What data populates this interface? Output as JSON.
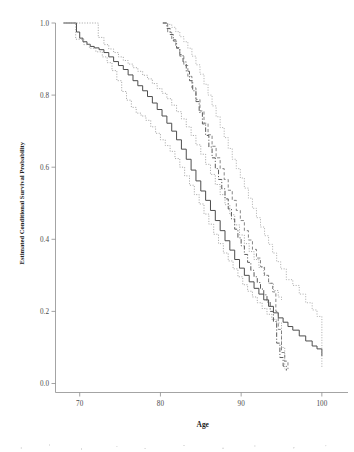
{
  "figure": {
    "background_color": "#ffffff",
    "axis_color": "#8d8d8d",
    "text_color": "#333333"
  },
  "chart_data": {
    "type": "line",
    "title": "",
    "xlabel": "Age",
    "ylabel": "Estimated Conditional Survival Probability",
    "xlim": [
      67,
      102
    ],
    "ylim": [
      0.0,
      1.0
    ],
    "xticks": [
      70,
      80,
      90,
      100
    ],
    "xtick_labels": [
      "70",
      "80",
      "90",
      "100"
    ],
    "yticks": [
      0.0,
      0.2,
      0.4,
      0.6,
      0.8,
      1.0
    ],
    "ytick_labels": [
      "0.0",
      "0.2",
      "0.4",
      "0.6",
      "0.8",
      "1.0"
    ],
    "grid": false,
    "legend": "none",
    "annotations": [],
    "series": [
      {
        "name": "Group A estimate",
        "style": "solid",
        "color": "#4d4d4d",
        "width": 1.0,
        "x": [
          68.0,
          69.1,
          69.6,
          70.0,
          70.4,
          70.9,
          71.3,
          71.8,
          72.4,
          73.0,
          73.6,
          74.2,
          74.8,
          75.4,
          76.0,
          76.6,
          77.2,
          77.8,
          78.4,
          79.0,
          79.6,
          80.2,
          80.8,
          81.4,
          82.0,
          82.6,
          83.2,
          83.8,
          84.4,
          85.0,
          85.6,
          86.2,
          86.8,
          87.4,
          88.0,
          88.6,
          89.2,
          89.8,
          90.4,
          91.0,
          91.6,
          92.2,
          92.8,
          93.4,
          94.0,
          94.6,
          95.2,
          95.8,
          96.4,
          97.2,
          98.0,
          98.8,
          99.4,
          100.0
        ],
        "y": [
          1.0,
          1.0,
          0.975,
          0.958,
          0.948,
          0.941,
          0.935,
          0.931,
          0.926,
          0.918,
          0.906,
          0.893,
          0.882,
          0.871,
          0.856,
          0.84,
          0.826,
          0.812,
          0.796,
          0.778,
          0.76,
          0.742,
          0.722,
          0.7,
          0.676,
          0.65,
          0.622,
          0.592,
          0.562,
          0.534,
          0.508,
          0.48,
          0.452,
          0.424,
          0.396,
          0.37,
          0.344,
          0.32,
          0.3,
          0.282,
          0.264,
          0.248,
          0.232,
          0.214,
          0.196,
          0.182,
          0.17,
          0.158,
          0.148,
          0.132,
          0.118,
          0.104,
          0.096,
          0.076
        ]
      },
      {
        "name": "Group A upper 95% CI",
        "style": "dotted",
        "color": "#9a9a9a",
        "width": 0.85,
        "x": [
          68.0,
          69.5,
          70.5,
          71.5,
          72.2,
          72.3,
          73.0,
          73.6,
          74.2,
          74.8,
          75.4,
          76.0,
          76.6,
          77.2,
          77.8,
          78.4,
          79.0,
          79.6,
          80.2,
          80.8,
          81.4,
          82.0,
          82.6,
          83.2,
          83.8,
          84.4,
          85.0,
          85.6,
          86.2,
          86.8,
          87.4,
          88.0,
          88.6,
          89.2,
          89.8,
          90.4,
          91.0,
          91.6,
          92.2,
          92.8,
          93.4,
          94.0,
          94.6,
          95.0
        ],
        "y": [
          1.0,
          1.0,
          1.0,
          1.0,
          1.0,
          0.96,
          0.94,
          0.928,
          0.918,
          0.906,
          0.896,
          0.886,
          0.876,
          0.866,
          0.855,
          0.845,
          0.832,
          0.818,
          0.805,
          0.79,
          0.772,
          0.754,
          0.734,
          0.712,
          0.688,
          0.662,
          0.636,
          0.608,
          0.58,
          0.552,
          0.524,
          0.496,
          0.468,
          0.44,
          0.412,
          0.388,
          0.366,
          0.344,
          0.322,
          0.3,
          0.278,
          0.258,
          0.24,
          0.232
        ]
      },
      {
        "name": "Group A lower 95% CI",
        "style": "dotted",
        "color": "#9a9a9a",
        "width": 0.85,
        "x": [
          68.0,
          69.5,
          70.5,
          71.2,
          72.0,
          72.8,
          73.4,
          74.0,
          74.6,
          75.2,
          75.8,
          76.4,
          77.0,
          77.6,
          78.2,
          78.8,
          79.4,
          80.0,
          80.6,
          81.2,
          81.8,
          82.4,
          83.0,
          83.6,
          84.2,
          84.8,
          85.4,
          86.0,
          86.6,
          87.2,
          87.8,
          88.4,
          89.0,
          89.6,
          90.2,
          90.8,
          91.4,
          92.0,
          92.6,
          93.2,
          93.8,
          94.4,
          95.0,
          95.4
        ],
        "y": [
          1.0,
          0.955,
          0.94,
          0.93,
          0.92,
          0.906,
          0.89,
          0.868,
          0.84,
          0.81,
          0.786,
          0.766,
          0.75,
          0.742,
          0.73,
          0.712,
          0.694,
          0.676,
          0.66,
          0.644,
          0.624,
          0.6,
          0.576,
          0.55,
          0.524,
          0.498,
          0.47,
          0.442,
          0.414,
          0.388,
          0.362,
          0.34,
          0.318,
          0.296,
          0.274,
          0.256,
          0.24,
          0.224,
          0.208,
          0.192,
          0.178,
          0.168,
          0.1,
          0.04
        ]
      },
      {
        "name": "Group B estimate",
        "style": "dashdot",
        "color": "#5a5a5a",
        "width": 1.0,
        "x": [
          80.3,
          80.8,
          81.2,
          81.6,
          82.0,
          82.4,
          82.8,
          83.2,
          83.6,
          84.0,
          84.4,
          84.8,
          85.2,
          85.6,
          86.0,
          86.4,
          86.8,
          87.2,
          87.6,
          88.0,
          88.4,
          88.8,
          89.2,
          89.6,
          90.0,
          90.4,
          90.8,
          91.2,
          91.6,
          92.0,
          92.4,
          92.8,
          93.2,
          93.6,
          94.0,
          94.4,
          94.8,
          95.2,
          95.6
        ],
        "y": [
          1.0,
          0.985,
          0.968,
          0.95,
          0.93,
          0.912,
          0.892,
          0.866,
          0.84,
          0.812,
          0.782,
          0.752,
          0.72,
          0.688,
          0.656,
          0.626,
          0.596,
          0.566,
          0.54,
          0.512,
          0.484,
          0.456,
          0.428,
          0.404,
          0.382,
          0.358,
          0.336,
          0.314,
          0.296,
          0.28,
          0.262,
          0.246,
          0.226,
          0.2,
          0.172,
          0.112,
          0.072,
          0.048,
          0.036
        ]
      },
      {
        "name": "Group B upper 95% CI",
        "style": "dotted",
        "color": "#a5a5a5",
        "width": 0.85,
        "x": [
          80.3,
          80.9,
          81.4,
          81.9,
          82.4,
          82.9,
          83.4,
          83.9,
          84.4,
          84.9,
          85.4,
          85.9,
          86.4,
          86.9,
          87.4,
          87.9,
          88.4,
          88.9,
          89.4,
          89.9,
          90.4,
          90.9,
          91.4,
          91.9,
          92.4,
          92.9,
          93.4,
          93.9,
          94.4,
          94.9,
          95.6,
          96.4,
          97.2,
          98.0,
          98.8,
          99.4,
          100.0
        ],
        "y": [
          1.0,
          0.996,
          0.988,
          0.976,
          0.962,
          0.948,
          0.93,
          0.908,
          0.884,
          0.858,
          0.83,
          0.8,
          0.77,
          0.74,
          0.71,
          0.682,
          0.652,
          0.622,
          0.596,
          0.57,
          0.542,
          0.514,
          0.486,
          0.46,
          0.434,
          0.41,
          0.386,
          0.362,
          0.338,
          0.318,
          0.288,
          0.272,
          0.248,
          0.224,
          0.204,
          0.186,
          0.042
        ]
      },
      {
        "name": "Group B lower 95% CI",
        "style": "dashed",
        "color": "#707070",
        "width": 0.85,
        "x": [
          80.3,
          80.9,
          81.4,
          81.9,
          82.4,
          82.9,
          83.4,
          83.9,
          84.4,
          84.9,
          85.4,
          85.9,
          86.4,
          86.9,
          87.4,
          87.9,
          88.4,
          88.9,
          89.4,
          89.9,
          90.4,
          90.9,
          91.4,
          91.9,
          92.4,
          92.9,
          93.4,
          93.9,
          94.3,
          94.6,
          95.0,
          95.4,
          95.8
        ],
        "y": [
          1.0,
          0.974,
          0.954,
          0.932,
          0.908,
          0.882,
          0.852,
          0.82,
          0.788,
          0.756,
          0.722,
          0.69,
          0.658,
          0.626,
          0.596,
          0.566,
          0.536,
          0.508,
          0.48,
          0.452,
          0.424,
          0.398,
          0.372,
          0.348,
          0.324,
          0.3,
          0.278,
          0.254,
          0.2,
          0.15,
          0.086,
          0.062,
          0.04
        ]
      }
    ]
  }
}
